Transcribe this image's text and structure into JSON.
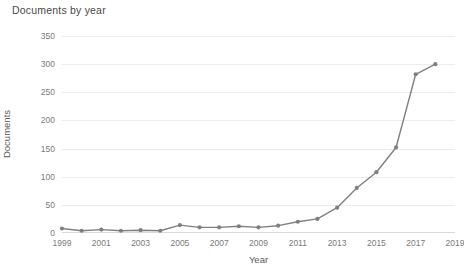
{
  "chart_data": {
    "type": "line",
    "title": "Documents by year",
    "xlabel": "Year",
    "ylabel": "Documents",
    "grid": true,
    "legend": "none",
    "line_color": "#808080",
    "marker_color": "#808080",
    "xlim": [
      1999,
      2019
    ],
    "ylim": [
      0,
      350
    ],
    "y_ticks": [
      0,
      50,
      100,
      150,
      200,
      250,
      300,
      350
    ],
    "y_tick_labels": [
      "0",
      "50",
      "100",
      "150",
      "200",
      "250",
      "300",
      "350"
    ],
    "x_ticks": [
      1999,
      2001,
      2003,
      2005,
      2007,
      2009,
      2011,
      2013,
      2015,
      2017,
      2019
    ],
    "x_tick_labels": [
      "1999",
      "2001",
      "2003",
      "2005",
      "2007",
      "2009",
      "2011",
      "2013",
      "2015",
      "2017",
      "2019"
    ],
    "x": [
      1999,
      2000,
      2001,
      2002,
      2003,
      2004,
      2005,
      2006,
      2007,
      2008,
      2009,
      2010,
      2011,
      2012,
      2013,
      2014,
      2015,
      2016,
      2017,
      2018
    ],
    "categories": [
      "1999",
      "2000",
      "2001",
      "2002",
      "2003",
      "2004",
      "2005",
      "2006",
      "2007",
      "2008",
      "2009",
      "2010",
      "2011",
      "2012",
      "2013",
      "2014",
      "2015",
      "2016",
      "2017",
      "2018"
    ],
    "values": [
      8,
      4,
      6,
      4,
      5,
      4,
      14,
      10,
      10,
      12,
      10,
      13,
      20,
      25,
      45,
      80,
      108,
      152,
      282,
      300
    ],
    "series": [
      {
        "name": "Documents",
        "values": [
          8,
          4,
          6,
          4,
          5,
          4,
          14,
          10,
          10,
          12,
          10,
          13,
          20,
          25,
          45,
          80,
          108,
          152,
          282,
          300
        ]
      }
    ]
  }
}
